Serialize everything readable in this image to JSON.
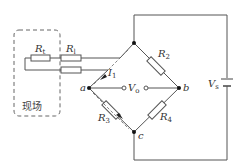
{
  "diagram": {
    "type": "wheatstone-bridge-circuit",
    "nodes": {
      "a": "a",
      "b": "b",
      "c": "c"
    },
    "resistors": {
      "r1": {
        "symbol": "R",
        "sub": "2"
      },
      "r3": {
        "symbol": "R",
        "sub": "3"
      },
      "r4": {
        "symbol": "R",
        "sub": "4"
      },
      "rt": {
        "symbol": "R",
        "sub": "t"
      },
      "rl": {
        "symbol": "R",
        "sub": "l"
      }
    },
    "current": {
      "symbol": "I",
      "sub": "1"
    },
    "output_voltage": {
      "symbol": "V",
      "sub": "o"
    },
    "supply_voltage": {
      "symbol": "V",
      "sub": "s"
    },
    "field_box_label": "现场"
  }
}
